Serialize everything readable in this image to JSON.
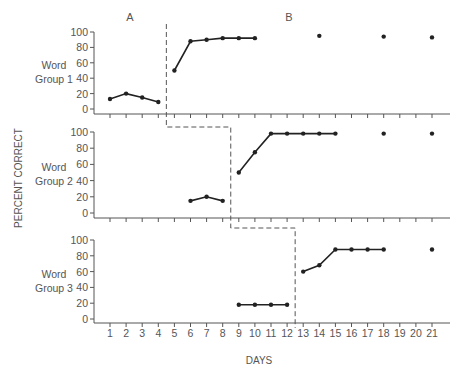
{
  "chart_data": {
    "type": "line",
    "title": "",
    "xlabel": "DAYS",
    "ylabel": "PERCENT CORRECT",
    "phase_labels": [
      "A",
      "B"
    ],
    "x": [
      1,
      2,
      3,
      4,
      5,
      6,
      7,
      8,
      9,
      10,
      11,
      12,
      13,
      14,
      15,
      16,
      17,
      18,
      19,
      20,
      21
    ],
    "ylim": [
      0,
      100
    ],
    "yticks": [
      0,
      20,
      40,
      60,
      80,
      100
    ],
    "grid": false,
    "legend": "none",
    "panels": [
      {
        "name": "Word Group 1",
        "label_line1": "Word",
        "label_line2": "Group 1",
        "phase_change_after_day": 4.5,
        "baseline": {
          "days": [
            1,
            2,
            3,
            4
          ],
          "values": [
            13,
            20,
            15,
            9
          ]
        },
        "treatment": {
          "days": [
            5,
            6,
            7,
            8,
            9,
            10
          ],
          "values": [
            50,
            88,
            90,
            92,
            92,
            92
          ]
        },
        "followup": {
          "days": [
            14,
            18,
            21
          ],
          "values": [
            95,
            94,
            93
          ]
        }
      },
      {
        "name": "Word Group 2",
        "label_line1": "Word",
        "label_line2": "Group 2",
        "phase_change_after_day": 8.5,
        "baseline": {
          "days": [
            6,
            7,
            8
          ],
          "values": [
            15,
            20,
            15
          ]
        },
        "treatment": {
          "days": [
            9,
            10,
            11,
            12,
            13,
            14,
            15
          ],
          "values": [
            50,
            75,
            98,
            98,
            98,
            98,
            98
          ]
        },
        "followup": {
          "days": [
            18,
            21
          ],
          "values": [
            98,
            98
          ]
        }
      },
      {
        "name": "Word Group 3",
        "label_line1": "Word",
        "label_line2": "Group 3",
        "phase_change_after_day": 12.5,
        "baseline": {
          "days": [
            9,
            10,
            11,
            12
          ],
          "values": [
            18,
            18,
            18,
            18
          ]
        },
        "treatment": {
          "days": [
            13,
            14,
            15,
            16,
            17,
            18
          ],
          "values": [
            60,
            68,
            88,
            88,
            88,
            88
          ]
        },
        "followup": {
          "days": [
            21
          ],
          "values": [
            88
          ]
        }
      }
    ]
  },
  "labels": {
    "phase_a": "A",
    "phase_b": "B",
    "y_axis": "PERCENT CORRECT",
    "x_axis": "DAYS"
  }
}
